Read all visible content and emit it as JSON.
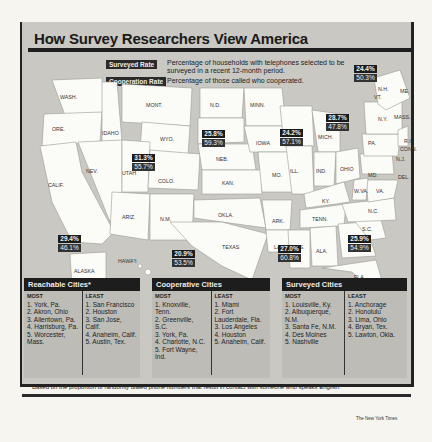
{
  "title": "How Survey Researchers View America",
  "legend": {
    "surveyed_label": "Surveyed Rate",
    "surveyed_desc": "Percentage of households with telephones selected to be surveyed in a recent 12-month period.",
    "cooperation_label": "Cooperation Rate",
    "cooperation_desc": "Percentage of those called who cooperated."
  },
  "states": [
    "WASH.",
    "ORE.",
    "CALIF.",
    "IDAHO",
    "NEV.",
    "MONT.",
    "WYO.",
    "UTAH",
    "COLO.",
    "ARIZ.",
    "N.M.",
    "N.D.",
    "S.D.",
    "NEB.",
    "KAN.",
    "OKLA.",
    "TEXAS",
    "MINN.",
    "IOWA",
    "MO.",
    "ARK.",
    "LA.",
    "WIS.",
    "ILL.",
    "MICH.",
    "IND.",
    "OHIO",
    "KY.",
    "TENN.",
    "MISS.",
    "ALA.",
    "GA.",
    "FLA.",
    "S.C.",
    "N.C.",
    "VA.",
    "W.VA.",
    "MD.",
    "DEL.",
    "PA.",
    "N.Y.",
    "N.J.",
    "CONN.",
    "R.I.",
    "MASS.",
    "VT.",
    "N.H.",
    "ME.",
    "ALASKA",
    "HAWAII"
  ],
  "region_stats": [
    {
      "region": "West (Calif.)",
      "surveyed": "29.4%",
      "cooperation": "46.1%"
    },
    {
      "region": "Mountain (Utah/Colo.)",
      "surveyed": "31.3%",
      "cooperation": "55.7%"
    },
    {
      "region": "Plains (S.D./Neb.)",
      "surveyed": "25.8%",
      "cooperation": "59.3%"
    },
    {
      "region": "Texas",
      "surveyed": "20.9%",
      "cooperation": "53.5%"
    },
    {
      "region": "Midwest (Mich.)",
      "surveyed": "24.2%",
      "cooperation": "57.1%"
    },
    {
      "region": "South (Ala.)",
      "surveyed": "27.0%",
      "cooperation": "60.8%"
    },
    {
      "region": "Mid-Atlantic (Pa./N.Y.)",
      "surveyed": "28.7%",
      "cooperation": "47.8%"
    },
    {
      "region": "Southeast (Ga.)",
      "surveyed": "25.9%",
      "cooperation": "54.9%"
    },
    {
      "region": "New England",
      "surveyed": "24.4%",
      "cooperation": "50.3%"
    }
  ],
  "source": "Source: Survey Sampling",
  "panels": [
    {
      "title": "Reachable Cities*",
      "most_label": "MOST",
      "least_label": "LEAST",
      "most": [
        "1. York, Pa.",
        "2. Akron, Ohio",
        "3. Allentown, Pa.",
        "4. Harrisburg, Pa.",
        "5. Worcester, Mass."
      ],
      "least": [
        "1. San Francisco",
        "2. Houston",
        "3. San Jose, Calif.",
        "4. Anaheim, Calif.",
        "5. Austin, Tex."
      ]
    },
    {
      "title": "Cooperative Cities",
      "most_label": "MOST",
      "least_label": "LEAST",
      "most": [
        "1. Knoxville, Tenn.",
        "2. Greenville, S.C.",
        "3. York, Pa.",
        "4. Charlotte, N.C.",
        "5. Fort Wayne, Ind."
      ],
      "least": [
        "1. Miami",
        "2. Fort Lauderdale, Fla.",
        "3. Los Angeles",
        "4. Houston",
        "5. Anaheim, Calif."
      ]
    },
    {
      "title": "Surveyed Cities",
      "most_label": "MOST",
      "least_label": "LEAST",
      "most": [
        "1. Louisville, Ky.",
        "2. Albuquerque, N.M.",
        "3. Santa Fe, N.M.",
        "4. Des Moines",
        "5. Nashville"
      ],
      "least": [
        "1. Anchorage",
        "2. Honolulu",
        "3. Lima, Ohio",
        "4. Bryan, Tex.",
        "5. Lawton, Okla."
      ]
    }
  ],
  "footnote": "* Based on the proportion of randomly dialed phone numbers that result in contact with someone who speaks English.",
  "credit": "The New York Times"
}
